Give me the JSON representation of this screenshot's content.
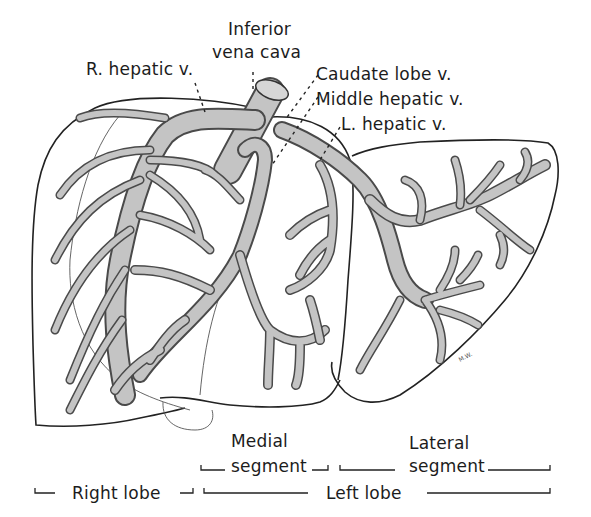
{
  "figure": {
    "labels": {
      "inferior_vena_cava_line1": "Inferior",
      "inferior_vena_cava_line2": "vena cava",
      "right_hepatic_vein": "R. hepatic v.",
      "caudate_lobe_vein": "Caudate lobe v.",
      "middle_hepatic_vein": "Middle hepatic v.",
      "left_hepatic_vein": "L. hepatic v."
    },
    "segments": {
      "medial_line1": "Medial",
      "medial_line2": "segment",
      "lateral_line1": "Lateral",
      "lateral_line2": "segment"
    },
    "lobes": {
      "right": "Right lobe",
      "left": "Left lobe"
    },
    "colors": {
      "vein_fill": "#c4c4c4",
      "vein_edge": "#4a4a4a",
      "outline": "#222222",
      "background": "#ffffff"
    }
  }
}
